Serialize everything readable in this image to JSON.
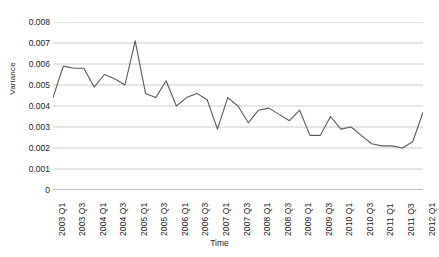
{
  "chart_data": {
    "type": "line",
    "title": "",
    "xlabel": "Time",
    "ylabel": "Variance",
    "ylim": [
      0,
      0.008
    ],
    "ytick_values": [
      0,
      0.001,
      0.002,
      0.003,
      0.004,
      0.005,
      0.006,
      0.007,
      0.008
    ],
    "ytick_labels": [
      "0",
      "0.001",
      "0.002",
      "0.003",
      "0.004",
      "0.005",
      "0.006",
      "0.007",
      "0.008"
    ],
    "grid": "horizontal",
    "legend": "none",
    "line_color": "#595959",
    "x": [
      "2003 Q1",
      "2003 Q2",
      "2003 Q3",
      "2003 Q4",
      "2004 Q1",
      "2004 Q2",
      "2004 Q3",
      "2004 Q4",
      "2005 Q1",
      "2005 Q2",
      "2005 Q3",
      "2005 Q4",
      "2006 Q1",
      "2006 Q2",
      "2006 Q3",
      "2006 Q4",
      "2007 Q1",
      "2007 Q2",
      "2007 Q3",
      "2007 Q4",
      "2008 Q1",
      "2008 Q2",
      "2008 Q3",
      "2008 Q4",
      "2009 Q1",
      "2009 Q2",
      "2009 Q3",
      "2009 Q4",
      "2010 Q1",
      "2010 Q2",
      "2010 Q3",
      "2010 Q4",
      "2011 Q1",
      "2011 Q2",
      "2011 Q3",
      "2011 Q4",
      "2012 Q1"
    ],
    "xtick_labels": [
      "2003 Q1",
      "2003 Q3",
      "2004 Q1",
      "2004 Q3",
      "2005 Q1",
      "2005 Q3",
      "2006 Q1",
      "2006 Q3",
      "2007 Q1",
      "2007 Q3",
      "2008 Q1",
      "2008 Q3",
      "2009 Q1",
      "2009 Q3",
      "2010 Q1",
      "2010 Q3",
      "2011 Q1",
      "2011 Q3",
      "2012 Q1"
    ],
    "values": [
      0.0044,
      0.0059,
      0.0058,
      0.0058,
      0.0049,
      0.0055,
      0.0053,
      0.005,
      0.0071,
      0.0046,
      0.0044,
      0.0052,
      0.004,
      0.0044,
      0.0046,
      0.0043,
      0.0029,
      0.0044,
      0.004,
      0.0032,
      0.0038,
      0.0039,
      0.0036,
      0.0033,
      0.0038,
      0.0026,
      0.0026,
      0.0035,
      0.0029,
      0.003,
      0.0026,
      0.0022,
      0.0021,
      0.0021,
      0.002,
      0.0023,
      0.0037
    ]
  }
}
